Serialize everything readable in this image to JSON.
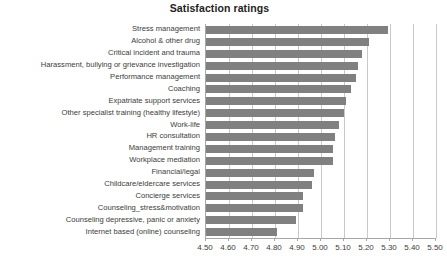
{
  "chart_data": {
    "type": "bar",
    "orientation": "horizontal",
    "title": "Satisfaction ratings",
    "xlabel": "",
    "ylabel": "",
    "xlim": [
      4.5,
      5.5
    ],
    "xticks": [
      "4.50",
      "4.60",
      "4.70",
      "4.80",
      "4.90",
      "5.00",
      "5.10",
      "5.20",
      "5.30",
      "5.40",
      "5.50"
    ],
    "grid": true,
    "legend": false,
    "bar_color": "#808080",
    "categories": [
      "Stress management",
      "Alcohol & other drug",
      "Critical incident and trauma",
      "Harassment, bullying or grievance investigation",
      "Performance management",
      "Coaching",
      "Expatriate support services",
      "Other specialist training (healthy lifestyle)",
      "Work-life",
      "HR consultation",
      "Management training",
      "Workplace mediation",
      "Financial/legal",
      "Childcare/eldercare services",
      "Concierge services",
      "Counseling_stress&motivation",
      "Counseling depressive, panic or anxiety",
      "Internet based (online) counseling"
    ],
    "values": [
      5.29,
      5.21,
      5.18,
      5.16,
      5.15,
      5.13,
      5.11,
      5.1,
      5.08,
      5.06,
      5.05,
      5.05,
      4.97,
      4.96,
      4.92,
      4.92,
      4.89,
      4.81
    ]
  }
}
